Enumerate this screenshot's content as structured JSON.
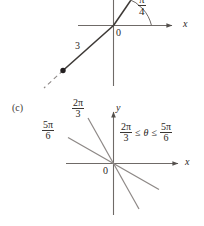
{
  "figure": {
    "background_color": "#ffffff",
    "ink_color": "#2b2724",
    "line_color": "#6f6a67",
    "ray_color": "#8d8886",
    "width": 204,
    "height": 226
  },
  "top_diagram": {
    "name": "negative-radius-polar-point",
    "origin_label": "0",
    "x_axis_label": "x",
    "radius_label": "3",
    "angle": {
      "numerator": "π",
      "denominator": "4",
      "text": "π/4"
    },
    "point_marker": "filled-dot",
    "extension_style": "dashed",
    "note_clipped_top": true
  },
  "bottom_diagram": {
    "name": "polar-sector-region",
    "part_label": "(c)",
    "origin_label": "0",
    "x_axis_label": "x",
    "y_axis_label": "y",
    "ray_labels": [
      {
        "numerator": "2π",
        "denominator": "3",
        "text": "2π/3"
      },
      {
        "numerator": "5π",
        "denominator": "6",
        "text": "5π/6"
      }
    ],
    "inequality": {
      "left": {
        "numerator": "2π",
        "denominator": "3"
      },
      "op_left": "≤",
      "variable": "θ",
      "op_right": "≤",
      "right": {
        "numerator": "5π",
        "denominator": "6"
      },
      "text": "2π/3 ≤ θ ≤ 5π/6"
    }
  }
}
